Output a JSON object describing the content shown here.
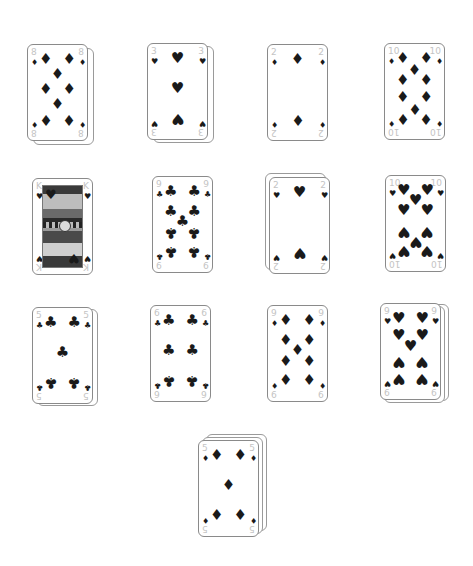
{
  "board": {
    "piles": [
      {
        "id": "pile-1",
        "rank": "8",
        "suit": "diamonds",
        "symbol": "♦",
        "x": 27,
        "y": 44,
        "stack": [
          {
            "dx": 6,
            "dy": 4
          }
        ],
        "pips": [
          [
            30,
            15
          ],
          [
            70,
            15
          ],
          [
            50,
            30
          ],
          [
            30,
            46
          ],
          [
            70,
            46
          ],
          [
            50,
            62
          ],
          [
            30,
            78,
            1
          ],
          [
            70,
            78,
            1
          ]
        ]
      },
      {
        "id": "pile-2",
        "rank": "3",
        "suit": "hearts",
        "symbol": "♥",
        "x": 147,
        "y": 43,
        "stack": [
          {
            "dx": 6,
            "dy": 3
          }
        ],
        "pips": [
          [
            50,
            15
          ],
          [
            50,
            46
          ],
          [
            50,
            78,
            1
          ]
        ]
      },
      {
        "id": "pile-3",
        "rank": "2",
        "suit": "diamonds",
        "symbol": "♦",
        "x": 267,
        "y": 44,
        "stack": [],
        "pips": [
          [
            50,
            15
          ],
          [
            50,
            78,
            1
          ]
        ]
      },
      {
        "id": "pile-4",
        "rank": "10",
        "suit": "diamonds",
        "symbol": "♦",
        "x": 384,
        "y": 43,
        "stack": [],
        "pips": [
          [
            30,
            15
          ],
          [
            70,
            15
          ],
          [
            50,
            27
          ],
          [
            30,
            38
          ],
          [
            70,
            38
          ],
          [
            30,
            56
          ],
          [
            70,
            56
          ],
          [
            50,
            67,
            1
          ],
          [
            30,
            78,
            1
          ],
          [
            70,
            78,
            1
          ]
        ]
      },
      {
        "id": "pile-5",
        "rank": "K",
        "suit": "hearts",
        "symbol": "♥",
        "x": 32,
        "y": 178,
        "stack": [],
        "face": true,
        "pips": []
      },
      {
        "id": "pile-6",
        "rank": "9",
        "suit": "clubs",
        "symbol": "♣",
        "x": 152,
        "y": 176,
        "stack": [],
        "pips": [
          [
            30,
            15
          ],
          [
            70,
            15
          ],
          [
            30,
            36
          ],
          [
            70,
            36
          ],
          [
            50,
            46
          ],
          [
            30,
            58,
            1
          ],
          [
            70,
            58,
            1
          ],
          [
            30,
            78,
            1
          ],
          [
            70,
            78,
            1
          ]
        ]
      },
      {
        "id": "pile-7",
        "rank": "2",
        "suit": "hearts",
        "symbol": "♥",
        "x": 269,
        "y": 177,
        "stack": [
          {
            "dx": -4,
            "dy": -4
          }
        ],
        "pips": [
          [
            50,
            15
          ],
          [
            50,
            78,
            1
          ]
        ]
      },
      {
        "id": "pile-8",
        "rank": "10",
        "suit": "hearts",
        "symbol": "♥",
        "x": 385,
        "y": 175,
        "stack": [],
        "pips": [
          [
            30,
            15
          ],
          [
            70,
            15
          ],
          [
            50,
            25
          ],
          [
            30,
            36
          ],
          [
            70,
            36
          ],
          [
            30,
            58,
            1
          ],
          [
            70,
            58,
            1
          ],
          [
            50,
            68,
            1
          ],
          [
            30,
            78,
            1
          ],
          [
            70,
            78,
            1
          ]
        ]
      },
      {
        "id": "pile-9",
        "rank": "5",
        "suit": "clubs",
        "symbol": "♣",
        "x": 32,
        "y": 307,
        "stack": [
          {
            "dx": 5,
            "dy": 2
          }
        ],
        "pips": [
          [
            30,
            15
          ],
          [
            70,
            15
          ],
          [
            50,
            46
          ],
          [
            30,
            78,
            1
          ],
          [
            70,
            78,
            1
          ]
        ]
      },
      {
        "id": "pile-10",
        "rank": "6",
        "suit": "clubs",
        "symbol": "♣",
        "x": 150,
        "y": 305,
        "stack": [],
        "pips": [
          [
            30,
            15
          ],
          [
            70,
            15
          ],
          [
            30,
            46
          ],
          [
            70,
            46
          ],
          [
            30,
            78,
            1
          ],
          [
            70,
            78,
            1
          ]
        ]
      },
      {
        "id": "pile-11",
        "rank": "9",
        "suit": "diamonds",
        "symbol": "♦",
        "x": 267,
        "y": 305,
        "stack": [],
        "pips": [
          [
            30,
            15
          ],
          [
            70,
            15
          ],
          [
            30,
            36
          ],
          [
            70,
            36
          ],
          [
            50,
            46
          ],
          [
            30,
            58
          ],
          [
            70,
            58
          ],
          [
            30,
            78
          ],
          [
            70,
            78
          ]
        ]
      },
      {
        "id": "pile-12",
        "rank": "9",
        "suit": "hearts",
        "symbol": "♥",
        "x": 380,
        "y": 303,
        "stack": [
          {
            "dx": 8,
            "dy": 1
          },
          {
            "dx": 4,
            "dy": 3
          }
        ],
        "pips": [
          [
            30,
            15
          ],
          [
            70,
            15
          ],
          [
            30,
            33
          ],
          [
            70,
            33
          ],
          [
            50,
            44
          ],
          [
            30,
            60,
            1
          ],
          [
            70,
            60,
            1
          ],
          [
            30,
            78,
            1
          ],
          [
            70,
            78,
            1
          ]
        ]
      },
      {
        "id": "pile-13",
        "rank": "5",
        "suit": "diamonds",
        "symbol": "♦",
        "x": 198,
        "y": 440,
        "stack": [
          {
            "dx": 8,
            "dy": -6
          },
          {
            "dx": 4,
            "dy": -3
          }
        ],
        "pips": [
          [
            30,
            15
          ],
          [
            70,
            15
          ],
          [
            50,
            46
          ],
          [
            30,
            78
          ],
          [
            70,
            78
          ]
        ]
      }
    ]
  },
  "colors": {
    "pip": "#1a1a1a",
    "index": "#c4c4c4",
    "border": "#8a8a8a",
    "background": "#ffffff"
  }
}
